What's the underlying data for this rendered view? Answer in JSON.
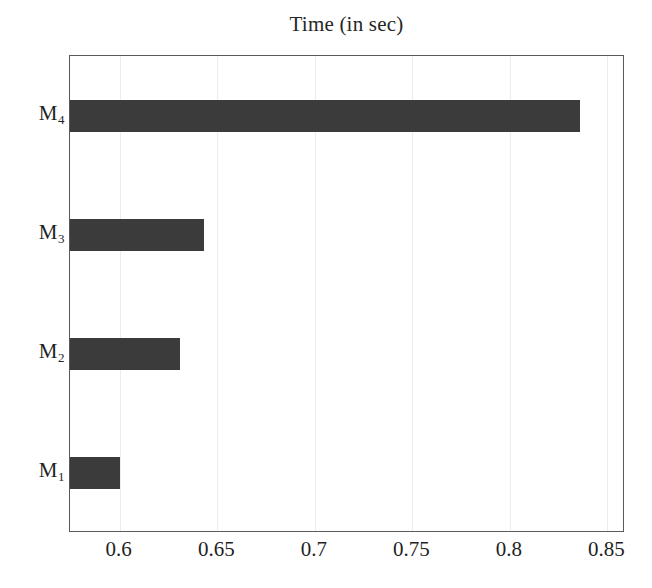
{
  "chart_data": {
    "type": "bar",
    "orientation": "horizontal",
    "title": "Time (in sec)",
    "xlabel": "",
    "ylabel": "",
    "categories": [
      "M1",
      "M2",
      "M3",
      "M4"
    ],
    "category_labels": [
      {
        "base": "M",
        "sub": "1"
      },
      {
        "base": "M",
        "sub": "2"
      },
      {
        "base": "M",
        "sub": "3"
      },
      {
        "base": "M",
        "sub": "4"
      }
    ],
    "values": [
      0.6,
      0.631,
      0.643,
      0.836
    ],
    "xlim": [
      0.5745,
      0.859
    ],
    "xticks": [
      0.6,
      0.65,
      0.7,
      0.75,
      0.8,
      0.85
    ],
    "xtick_labels": [
      "0.6",
      "0.65",
      "0.7",
      "0.75",
      "0.8",
      "0.85"
    ],
    "grid": true,
    "grid_axis": "x",
    "legend": "none",
    "bar_color": "#3b3b3b",
    "frame_color": "#5a5a5a",
    "grid_color": "#ededed",
    "background": "#ffffff"
  }
}
